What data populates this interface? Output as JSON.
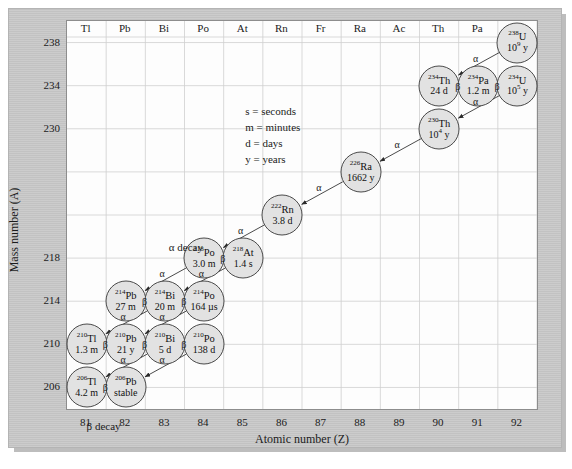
{
  "figure": {
    "title_axis_x": "Atomic number (Z)",
    "title_axis_y": "Mass number (A)",
    "alpha_decay_label": "α decay",
    "beta_decay_label": "β decay",
    "alpha_glyph": "α",
    "beta_glyph": "β"
  },
  "legend": {
    "line1": "s = seconds",
    "line2": "m = minutes",
    "line3": "d = days",
    "line4": "y = years"
  },
  "chart_data": {
    "type": "scatter",
    "xlabel": "Atomic number (Z)",
    "ylabel": "Mass number (A)",
    "xlim": [
      80.5,
      92.5
    ],
    "ylim": [
      204,
      240
    ],
    "xticks": [
      81,
      82,
      83,
      84,
      85,
      86,
      87,
      88,
      89,
      90,
      91,
      92
    ],
    "yticks": [
      238,
      234,
      230,
      226,
      222,
      218,
      214,
      210,
      206
    ],
    "ytick_labels": [
      "238",
      "234",
      "230",
      "",
      "",
      "218",
      "214",
      "210",
      "206"
    ],
    "grid": true,
    "legend_position": "inside-upper-left",
    "element_symbols": [
      {
        "z": 81,
        "symbol": "Tl"
      },
      {
        "z": 82,
        "symbol": "Pb"
      },
      {
        "z": 83,
        "symbol": "Bi"
      },
      {
        "z": 84,
        "symbol": "Po"
      },
      {
        "z": 85,
        "symbol": "At"
      },
      {
        "z": 86,
        "symbol": "Rn"
      },
      {
        "z": 87,
        "symbol": "Fr"
      },
      {
        "z": 88,
        "symbol": "Ra"
      },
      {
        "z": 89,
        "symbol": "Ac"
      },
      {
        "z": 90,
        "symbol": "Th"
      },
      {
        "z": 91,
        "symbol": "Pa"
      },
      {
        "z": 92,
        "symbol": "V"
      }
    ],
    "nuclides": [
      {
        "id": "u238",
        "mass": "238",
        "element": "U",
        "halflife": "10",
        "halflife_exp": "9",
        "halflife_unit": " y",
        "z": 92,
        "a": 238
      },
      {
        "id": "th234",
        "mass": "234",
        "element": "Th",
        "halflife": "24 d",
        "halflife_exp": "",
        "halflife_unit": "",
        "z": 90,
        "a": 234
      },
      {
        "id": "pa234",
        "mass": "234",
        "element": "Pa",
        "halflife": "1.2 m",
        "halflife_exp": "",
        "halflife_unit": "",
        "z": 91,
        "a": 234
      },
      {
        "id": "u234",
        "mass": "234",
        "element": "U",
        "halflife": "10",
        "halflife_exp": "5",
        "halflife_unit": " y",
        "z": 92,
        "a": 234
      },
      {
        "id": "th230",
        "mass": "230",
        "element": "Th",
        "halflife": "10",
        "halflife_exp": "4",
        "halflife_unit": " y",
        "z": 90,
        "a": 230
      },
      {
        "id": "ra226",
        "mass": "226",
        "element": "Ra",
        "halflife": "1662 y",
        "halflife_exp": "",
        "halflife_unit": "",
        "z": 88,
        "a": 226
      },
      {
        "id": "rn222",
        "mass": "222",
        "element": "Rn",
        "halflife": "3.8 d",
        "halflife_exp": "",
        "halflife_unit": "",
        "z": 86,
        "a": 222
      },
      {
        "id": "po218",
        "mass": "218",
        "element": "Po",
        "halflife": "3.0 m",
        "halflife_exp": "",
        "halflife_unit": "",
        "z": 84,
        "a": 218
      },
      {
        "id": "at218",
        "mass": "218",
        "element": "At",
        "halflife": "1.4 s",
        "halflife_exp": "",
        "halflife_unit": "",
        "z": 85,
        "a": 218
      },
      {
        "id": "pb214",
        "mass": "214",
        "element": "Pb",
        "halflife": "27 m",
        "halflife_exp": "",
        "halflife_unit": "",
        "z": 82,
        "a": 214
      },
      {
        "id": "bi214",
        "mass": "214",
        "element": "Bi",
        "halflife": "20 m",
        "halflife_exp": "",
        "halflife_unit": "",
        "z": 83,
        "a": 214
      },
      {
        "id": "po214",
        "mass": "214",
        "element": "Po",
        "halflife": "164 µs",
        "halflife_exp": "",
        "halflife_unit": "",
        "z": 84,
        "a": 214
      },
      {
        "id": "tl210",
        "mass": "210",
        "element": "Tl",
        "halflife": "1.3 m",
        "halflife_exp": "",
        "halflife_unit": "",
        "z": 81,
        "a": 210
      },
      {
        "id": "pb210",
        "mass": "210",
        "element": "Pb",
        "halflife": "21 y",
        "halflife_exp": "",
        "halflife_unit": "",
        "z": 82,
        "a": 210
      },
      {
        "id": "bi210",
        "mass": "210",
        "element": "Bi",
        "halflife": "5 d",
        "halflife_exp": "",
        "halflife_unit": "",
        "z": 83,
        "a": 210
      },
      {
        "id": "po210",
        "mass": "210",
        "element": "Po",
        "halflife": "138 d",
        "halflife_exp": "",
        "halflife_unit": "",
        "z": 84,
        "a": 210
      },
      {
        "id": "tl206",
        "mass": "206",
        "element": "Tl",
        "halflife": "4.2 m",
        "halflife_exp": "",
        "halflife_unit": "",
        "z": 81,
        "a": 206
      },
      {
        "id": "pb206",
        "mass": "206",
        "element": "Pb",
        "halflife": "stable",
        "halflife_exp": "",
        "halflife_unit": "",
        "z": 82,
        "a": 206
      }
    ],
    "decays": [
      {
        "from": "u238",
        "to": "th234",
        "type": "alpha"
      },
      {
        "from": "th234",
        "to": "pa234",
        "type": "beta"
      },
      {
        "from": "pa234",
        "to": "u234",
        "type": "beta"
      },
      {
        "from": "u234",
        "to": "th230",
        "type": "alpha"
      },
      {
        "from": "th230",
        "to": "ra226",
        "type": "alpha"
      },
      {
        "from": "ra226",
        "to": "rn222",
        "type": "alpha"
      },
      {
        "from": "rn222",
        "to": "po218",
        "type": "alpha"
      },
      {
        "from": "po218",
        "to": "at218",
        "type": "beta"
      },
      {
        "from": "po218",
        "to": "pb214",
        "type": "alpha"
      },
      {
        "from": "at218",
        "to": "bi214",
        "type": "alpha"
      },
      {
        "from": "pb214",
        "to": "bi214",
        "type": "beta"
      },
      {
        "from": "bi214",
        "to": "po214",
        "type": "beta"
      },
      {
        "from": "bi214",
        "to": "tl210",
        "type": "alpha"
      },
      {
        "from": "po214",
        "to": "pb210",
        "type": "alpha"
      },
      {
        "from": "tl210",
        "to": "pb210",
        "type": "beta"
      },
      {
        "from": "pb210",
        "to": "bi210",
        "type": "beta"
      },
      {
        "from": "bi210",
        "to": "po210",
        "type": "beta"
      },
      {
        "from": "bi210",
        "to": "tl206",
        "type": "alpha"
      },
      {
        "from": "po210",
        "to": "pb206",
        "type": "alpha"
      },
      {
        "from": "tl206",
        "to": "pb206",
        "type": "beta"
      }
    ]
  }
}
